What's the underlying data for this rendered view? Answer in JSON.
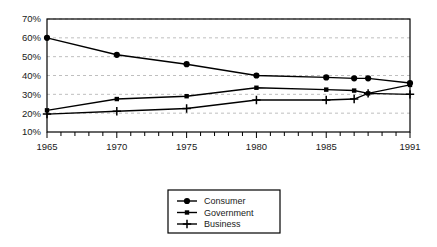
{
  "chart_data": {
    "type": "line",
    "title": "",
    "subtitle": "",
    "xlabel": "",
    "ylabel": "",
    "x": [
      1965,
      1970,
      1975,
      1980,
      1985,
      1987,
      1988,
      1991
    ],
    "xlim": [
      1965,
      1991
    ],
    "ylim": [
      10,
      70
    ],
    "yticks": [
      10,
      20,
      30,
      40,
      50,
      60,
      70
    ],
    "ytick_labels": [
      "10%",
      "20%",
      "30%",
      "40%",
      "50%",
      "60%",
      "70%"
    ],
    "xticks": [
      1965,
      1966,
      1967,
      1968,
      1969,
      1970,
      1971,
      1972,
      1973,
      1974,
      1975,
      1976,
      1977,
      1978,
      1979,
      1980,
      1981,
      1982,
      1983,
      1984,
      1985,
      1986,
      1987,
      1988,
      1989,
      1990,
      1991
    ],
    "xtick_labels": [
      "1965",
      "1970",
      "1975",
      "1980",
      "1985",
      "1991"
    ],
    "xtick_labeled_values": [
      1965,
      1970,
      1975,
      1980,
      1985,
      1991
    ],
    "grid": "horizontal-dashed",
    "legend_position": "below-center",
    "series": [
      {
        "name": "Consumer",
        "marker": "filled-circle",
        "color": "#000000",
        "values": [
          60.0,
          51.0,
          46.0,
          40.0,
          39.0,
          38.5,
          38.5,
          36.0
        ]
      },
      {
        "name": "Government",
        "marker": "filled-square",
        "color": "#000000",
        "values": [
          21.5,
          27.5,
          29.0,
          33.5,
          32.5,
          32.0,
          30.5,
          35.0
        ]
      },
      {
        "name": "Business",
        "marker": "plus",
        "color": "#000000",
        "values": [
          19.5,
          21.0,
          22.5,
          27.0,
          27.0,
          27.5,
          30.5,
          30.0
        ]
      }
    ]
  },
  "legend": {
    "items": [
      {
        "label": "Consumer",
        "marker": "filled-circle"
      },
      {
        "label": "Government",
        "marker": "filled-square"
      },
      {
        "label": "Business",
        "marker": "plus"
      }
    ]
  },
  "colors": {
    "ink": "#000000",
    "grid": "#b8b8b8",
    "background": "#ffffff"
  }
}
